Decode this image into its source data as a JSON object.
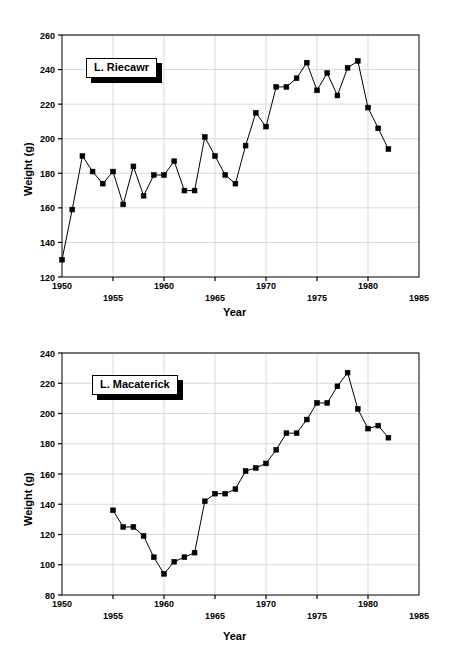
{
  "figures": [
    {
      "id": "riecawr",
      "callout_label": "L. Riecawr",
      "xlabel": "Year",
      "ylabel": "Weight (g)",
      "chart_data": {
        "type": "line",
        "title": "L. Riecawr",
        "xlabel": "Year",
        "ylabel": "Weight (g)",
        "xlim": [
          1950,
          1985
        ],
        "ylim": [
          120,
          260
        ],
        "xticks": [
          1950,
          1955,
          1960,
          1965,
          1970,
          1975,
          1980,
          1985
        ],
        "yticks": [
          120,
          140,
          160,
          180,
          200,
          220,
          240,
          260
        ],
        "grid": true,
        "legend": "none",
        "marker": "square",
        "series": [
          {
            "name": "L. Riecawr",
            "x": [
              1950,
              1951,
              1952,
              1953,
              1954,
              1955,
              1956,
              1957,
              1958,
              1959,
              1960,
              1961,
              1962,
              1963,
              1964,
              1965,
              1966,
              1967,
              1968,
              1969,
              1970,
              1971,
              1972,
              1973,
              1974,
              1975,
              1976,
              1977,
              1978,
              1979,
              1980,
              1981,
              1982
            ],
            "values": [
              130,
              159,
              190,
              181,
              174,
              181,
              162,
              184,
              167,
              179,
              179,
              187,
              170,
              170,
              201,
              190,
              179,
              174,
              196,
              215,
              207,
              230,
              230,
              235,
              244,
              228,
              238,
              225,
              241,
              245,
              218,
              206,
              194
            ]
          }
        ]
      }
    },
    {
      "id": "macaterick",
      "callout_label": "L. Macaterick",
      "xlabel": "Year",
      "ylabel": "Weight (g)",
      "chart_data": {
        "type": "line",
        "title": "L. Macaterick",
        "xlabel": "Year",
        "ylabel": "Weight (g)",
        "xlim": [
          1950,
          1985
        ],
        "ylim": [
          80,
          240
        ],
        "xticks": [
          1950,
          1955,
          1960,
          1965,
          1970,
          1975,
          1980,
          1985
        ],
        "yticks": [
          80,
          100,
          120,
          140,
          160,
          180,
          200,
          220,
          240
        ],
        "grid": true,
        "legend": "none",
        "marker": "square",
        "series": [
          {
            "name": "L. Macaterick",
            "x": [
              1955,
              1956,
              1957,
              1958,
              1959,
              1960,
              1961,
              1962,
              1963,
              1964,
              1965,
              1966,
              1967,
              1968,
              1969,
              1970,
              1971,
              1972,
              1973,
              1974,
              1975,
              1976,
              1977,
              1978,
              1979,
              1980,
              1981,
              1982
            ],
            "values": [
              136,
              125,
              125,
              119,
              105,
              94,
              102,
              105,
              108,
              142,
              147,
              147,
              150,
              162,
              164,
              167,
              176,
              187,
              187,
              196,
              207,
              207,
              218,
              227,
              203,
              190,
              192,
              184
            ]
          }
        ]
      }
    }
  ],
  "style": {
    "line_color": "#000000",
    "marker_color": "#000000",
    "axis_color": "#000000",
    "grid_color": "#d9d9d9",
    "background": "#ffffff"
  }
}
